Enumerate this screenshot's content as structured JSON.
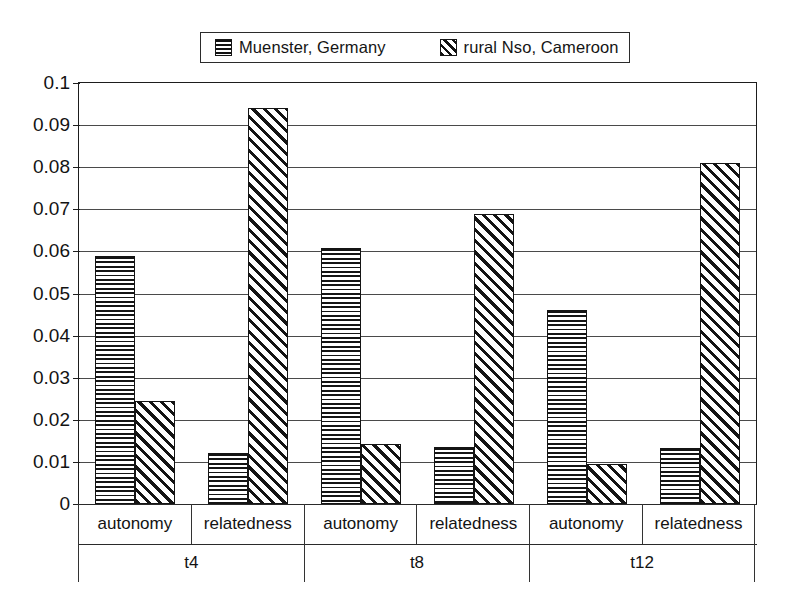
{
  "chart_data": {
    "type": "bar",
    "title": "",
    "subtitle": "",
    "xlabel": "",
    "ylabel": "",
    "ylim": [
      0,
      0.1
    ],
    "ytick_step": 0.01,
    "yticks": [
      "0",
      "0.01",
      "0.02",
      "0.03",
      "0.04",
      "0.05",
      "0.06",
      "0.07",
      "0.08",
      "0.09",
      "0.1"
    ],
    "ytick_values": [
      0,
      0.01,
      0.02,
      0.03,
      0.04,
      0.05,
      0.06,
      0.07,
      0.08,
      0.09,
      0.1
    ],
    "grid": "horizontal",
    "legend_position": "top-center",
    "groups": [
      "t4",
      "t8",
      "t12"
    ],
    "subcategories": [
      "autonomy",
      "relatedness"
    ],
    "categories": [
      "t4 / autonomy",
      "t4 / relatedness",
      "t8 / autonomy",
      "t8 / relatedness",
      "t12 / autonomy",
      "t12 / relatedness"
    ],
    "series": [
      {
        "name": "Muenster, Germany",
        "pattern": "horizontal-lines",
        "values": [
          0.059,
          0.012,
          0.0607,
          0.0136,
          0.046,
          0.0133
        ]
      },
      {
        "name": "rural Nso, Cameroon",
        "pattern": "diagonal-hatch",
        "values": [
          0.0245,
          0.094,
          0.0142,
          0.069,
          0.0095,
          0.081
        ]
      }
    ]
  },
  "legend": {
    "entries": [
      {
        "label": "Muenster, Germany"
      },
      {
        "label": "rural Nso, Cameroon"
      }
    ]
  },
  "axis": {
    "sub_labels": [
      "autonomy",
      "relatedness",
      "autonomy",
      "relatedness",
      "autonomy",
      "relatedness"
    ],
    "group_labels": [
      "t4",
      "t8",
      "t12"
    ]
  },
  "colors": {
    "ink": "#141414",
    "grid": "#4a4a4a",
    "frame": "#1d1d1d",
    "background": "#ffffff"
  }
}
